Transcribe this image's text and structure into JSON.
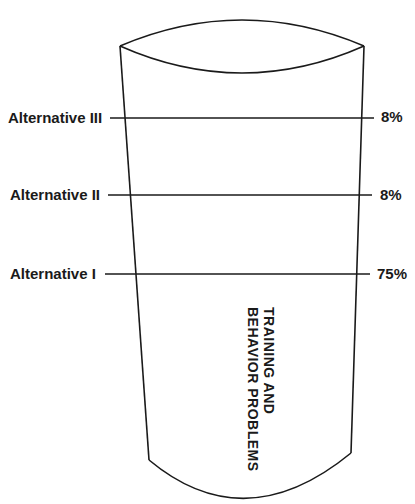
{
  "diagram": {
    "type": "funnel-vessel",
    "vessel_label_lines": [
      "TRAINING AND",
      "BEHAVIOR PROBLEMS"
    ],
    "alternatives": [
      {
        "label": "Alternative III",
        "percent": "8%"
      },
      {
        "label": "Alternative II",
        "percent": "8%"
      },
      {
        "label": "Alternative I",
        "percent": "75%"
      }
    ],
    "colors": {
      "line": "#1a1a1a",
      "background": "#ffffff"
    }
  }
}
